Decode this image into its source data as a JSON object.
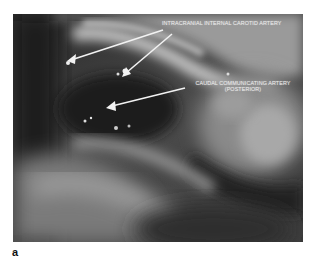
{
  "figure": {
    "panel_label": "a",
    "image_description": "grayscale intraoperative endoscopic photograph with annotation arrows",
    "annotations": [
      {
        "id": "ica",
        "text": "INTRACRANIAL INTERNAL CAROTID ARTERY",
        "arrow_count": 2
      },
      {
        "id": "pcom",
        "line1": "CAUDAL COMMUNICATING ARTERY",
        "line2": "(POSTERIOR)",
        "arrow_count": 1
      }
    ],
    "colors": {
      "annotation": "#e6e6e6",
      "arrow": "#f2f2f2",
      "background": "#ffffff",
      "label": "#111111"
    }
  }
}
